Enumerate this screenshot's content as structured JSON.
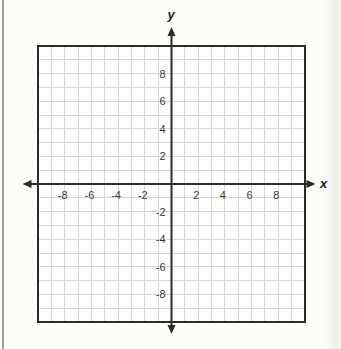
{
  "page": {
    "background": "#fcfcf9",
    "left_rule_color": "#9e9e9e",
    "right_band_visible": true
  },
  "chart_data": {
    "type": "scatter",
    "title": "",
    "xlabel": "x",
    "ylabel": "y",
    "xlim": [
      -10,
      10
    ],
    "ylim": [
      -10,
      10
    ],
    "grid": true,
    "grid_step": 1,
    "label_step": 2,
    "x_tick_labels": [
      -8,
      -6,
      -4,
      -2,
      2,
      4,
      6,
      8
    ],
    "y_tick_labels": [
      8,
      6,
      4,
      2,
      -2,
      -4,
      -6,
      -8
    ],
    "origin_label_shown": false,
    "series": [],
    "legend_position": "none",
    "colors": {
      "grid_line": "#d6d6d6",
      "axis_line": "#2c2c2c",
      "plot_border": "#2b2b2b",
      "tick_text": "#3a3a3a",
      "plot_background": "#ffffff"
    }
  }
}
